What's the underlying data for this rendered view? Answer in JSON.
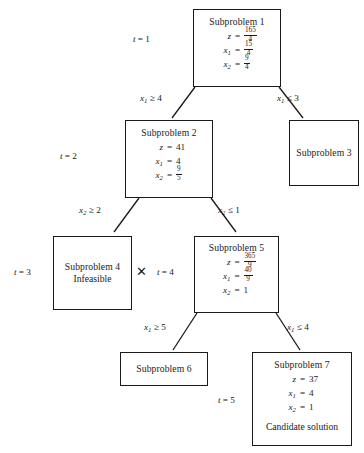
{
  "diagram": {
    "line_color": "#1a1a1a",
    "background": "#ffffff"
  },
  "nodes": [
    {
      "id": "subproblem-1",
      "title": "Subproblem 1",
      "equations": [
        {
          "lhs": "z",
          "sub": "",
          "rel": "=",
          "num": "165",
          "den": "4"
        },
        {
          "lhs": "x",
          "sub": "1",
          "rel": "=",
          "num": "15",
          "den": "4"
        },
        {
          "lhs": "x",
          "sub": "2",
          "rel": "=",
          "num": "9",
          "den": "4"
        }
      ],
      "note": ""
    },
    {
      "id": "subproblem-2",
      "title": "Subproblem 2",
      "equations": [
        {
          "lhs": "z",
          "sub": "",
          "rel": "=",
          "value": "41"
        },
        {
          "lhs": "x",
          "sub": "1",
          "rel": "=",
          "value": "4"
        },
        {
          "lhs": "x",
          "sub": "2",
          "rel": "=",
          "num": "9",
          "den": "5"
        }
      ],
      "note": ""
    },
    {
      "id": "subproblem-3",
      "title": "Subproblem 3",
      "equations": [],
      "note": ""
    },
    {
      "id": "subproblem-4",
      "title": "Subproblem 4",
      "equations": [],
      "note": "Infeasible"
    },
    {
      "id": "subproblem-5",
      "title": "Subproblem 5",
      "equations": [
        {
          "lhs": "z",
          "sub": "",
          "rel": "=",
          "num": "365",
          "den": "9"
        },
        {
          "lhs": "x",
          "sub": "1",
          "rel": "=",
          "num": "40",
          "den": "9"
        },
        {
          "lhs": "x",
          "sub": "2",
          "rel": "=",
          "value": "1"
        }
      ],
      "note": ""
    },
    {
      "id": "subproblem-6",
      "title": "Subproblem 6",
      "equations": [],
      "note": ""
    },
    {
      "id": "subproblem-7",
      "title": "Subproblem 7",
      "equations": [
        {
          "lhs": "z",
          "sub": "",
          "rel": "=",
          "value": "37"
        },
        {
          "lhs": "x",
          "sub": "1",
          "rel": "=",
          "value": "4"
        },
        {
          "lhs": "x",
          "sub": "2",
          "rel": "=",
          "value": "1"
        }
      ],
      "note": "Candidate solution"
    }
  ],
  "iteration_labels": [
    {
      "id": "t-1",
      "var": "t",
      "rel": "=",
      "value": "1"
    },
    {
      "id": "t-2",
      "var": "t",
      "rel": "=",
      "value": "2"
    },
    {
      "id": "t-3",
      "var": "t",
      "rel": "=",
      "value": "3"
    },
    {
      "id": "t-4",
      "var": "t",
      "rel": "=",
      "value": "4"
    },
    {
      "id": "t-5",
      "var": "t",
      "rel": "=",
      "value": "5"
    }
  ],
  "branch_labels": [
    {
      "id": "branch-x1-ge-4",
      "var": "x",
      "sub": "1",
      "rel": "≥",
      "value": "4"
    },
    {
      "id": "branch-x1-le-3",
      "var": "x",
      "sub": "1",
      "rel": "≤",
      "value": "3"
    },
    {
      "id": "branch-x2-ge-2",
      "var": "x",
      "sub": "2",
      "rel": "≥",
      "value": "2"
    },
    {
      "id": "branch-x2-le-1",
      "var": "x",
      "sub": "2",
      "rel": "≤",
      "value": "1"
    },
    {
      "id": "branch-x1-ge-5",
      "var": "x",
      "sub": "1",
      "rel": "≥",
      "value": "5"
    },
    {
      "id": "branch-x1-le-4",
      "var": "x",
      "sub": "1",
      "rel": "≤",
      "value": "4"
    }
  ],
  "markers": [
    {
      "id": "pruned-mark-subproblem-4",
      "glyph": "✕"
    }
  ]
}
